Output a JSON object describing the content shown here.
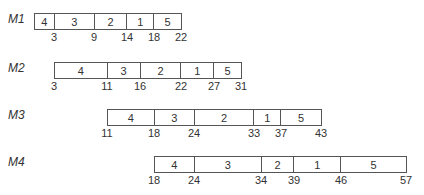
{
  "scale": {
    "origin_px": 34,
    "px_per_unit": 6.5
  },
  "machines": [
    {
      "label": "M1",
      "label_x": 8,
      "label_y": 12,
      "box_y": 13,
      "start": 0,
      "segments": [
        {
          "job": "4",
          "end": 3
        },
        {
          "job": "3",
          "end": 9
        },
        {
          "job": "2",
          "end": 14
        },
        {
          "job": "1",
          "end": 18
        },
        {
          "job": "5",
          "end": 22
        }
      ],
      "tick_labels": [
        "3",
        "9",
        "14",
        "18",
        "22"
      ]
    },
    {
      "label": "M2",
      "label_x": 8,
      "label_y": 61,
      "box_y": 62,
      "start": 3,
      "segments": [
        {
          "job": "4",
          "end": 11
        },
        {
          "job": "3",
          "end": 16
        },
        {
          "job": "2",
          "end": 22
        },
        {
          "job": "1",
          "end": 27
        },
        {
          "job": "5",
          "end": 31
        }
      ],
      "tick_labels": [
        "3",
        "11",
        "16",
        "22",
        "27",
        "31"
      ]
    },
    {
      "label": "M3",
      "label_x": 8,
      "label_y": 108,
      "box_y": 109,
      "start": 11,
      "segments": [
        {
          "job": "4",
          "end": 18
        },
        {
          "job": "3",
          "end": 24
        },
        {
          "job": "2",
          "end": 33
        },
        {
          "job": "1",
          "end": 37
        },
        {
          "job": "5",
          "end": 43
        }
      ],
      "tick_labels": [
        "11",
        "18",
        "24",
        "33",
        "37",
        "43"
      ]
    },
    {
      "label": "M4",
      "label_x": 8,
      "label_y": 155,
      "box_y": 156,
      "start": 18,
      "segments": [
        {
          "job": "4",
          "end": 24
        },
        {
          "job": "3",
          "end": 34
        },
        {
          "job": "2",
          "end": 39
        },
        {
          "job": "1",
          "end": 46
        },
        {
          "job": "5",
          "end": 57
        }
      ],
      "tick_labels": [
        "18",
        "24",
        "34",
        "39",
        "46",
        "57"
      ]
    }
  ]
}
